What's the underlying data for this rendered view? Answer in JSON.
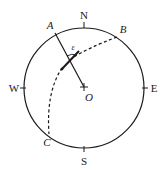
{
  "diagram": {
    "type": "compass-circle",
    "stroke_color": "#1a1a1a",
    "background": "#ffffff",
    "circle": {
      "cx": 84,
      "cy": 88,
      "r": 60
    },
    "compass_labels": {
      "north": "N",
      "south": "S",
      "west": "W",
      "east": "E"
    },
    "points": {
      "A": "A",
      "B": "B",
      "C": "C",
      "O": "O"
    },
    "angle_label": "ε",
    "edges": [
      {
        "from": "A",
        "to": "O",
        "style": "solid"
      },
      {
        "from": "B",
        "to": "C",
        "style": "dashed-arc",
        "via": "crossing point near A–O line"
      }
    ]
  }
}
